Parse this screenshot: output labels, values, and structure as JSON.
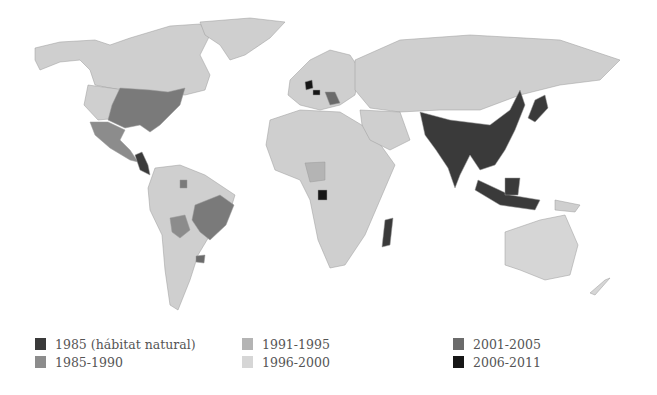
{
  "colors": {
    "c1985_natural": "#3a3a3a",
    "c1985_1990": "#8c8c8c",
    "c1991_1995": "#b4b4b4",
    "c1996_2000": "#d6d6d6",
    "c2001_2005": "#6b6b6b",
    "c2006_2011": "#161616",
    "base_land": "#cfcfcf"
  },
  "legend": [
    {
      "label": "1985 (hábitat natural)",
      "color": "#3a3a3a"
    },
    {
      "label": "1985-1990",
      "color": "#8c8c8c"
    },
    {
      "label": "1991-1995",
      "color": "#b4b4b4"
    },
    {
      "label": "1996-2000",
      "color": "#d6d6d6"
    },
    {
      "label": "2001-2005",
      "color": "#6b6b6b"
    },
    {
      "label": "2006-2011",
      "color": "#161616"
    }
  ],
  "regions": [
    {
      "name": "East/South/Southeast Asia",
      "period": "1985 (hábitat natural)"
    },
    {
      "name": "Japan",
      "period": "1985 (hábitat natural)"
    },
    {
      "name": "Madagascar",
      "period": "1985 (hábitat natural)"
    },
    {
      "name": "Eastern United States",
      "period": "2001-2005"
    },
    {
      "name": "Brazil",
      "period": "2001-2005"
    },
    {
      "name": "Uruguay",
      "period": "2001-2005"
    },
    {
      "name": "Mexico",
      "period": "1985-1990"
    },
    {
      "name": "Bolivia",
      "period": "1985-1990"
    },
    {
      "name": "Nigeria",
      "period": "1991-1995"
    },
    {
      "name": "Gabon",
      "period": "2006-2011"
    },
    {
      "name": "France/Belgium",
      "period": "2006-2011"
    },
    {
      "name": "Balkans",
      "period": "2001-2005"
    },
    {
      "name": "Central America",
      "period": "1985 (hábitat natural)"
    }
  ]
}
